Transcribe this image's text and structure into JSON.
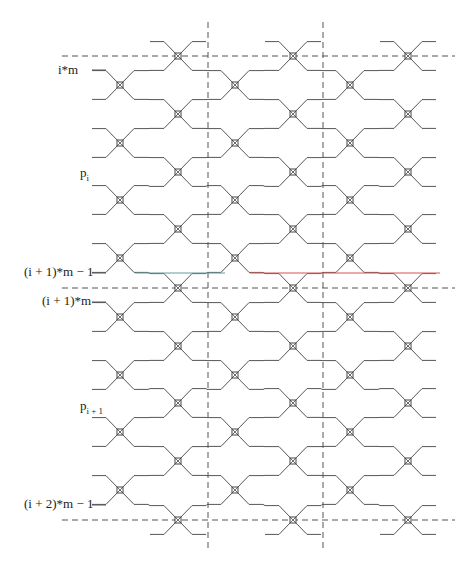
{
  "labels": {
    "row_top": "i*m",
    "block_i": "p",
    "block_i_sub": "i",
    "row_end_i": "(i + 1)*m − 1",
    "row_start_next": "(i + 1)*m",
    "block_next": "p",
    "block_next_sub": "i + 1",
    "row_end_next": "(i + 2)*m − 1"
  },
  "colors": {
    "wire": "#555555",
    "dash": "#555555",
    "node": "#444444",
    "highlight_teal": "#5a9e9a",
    "highlight_red": "#d9534f"
  },
  "geometry": {
    "colA_x": [
      120,
      235,
      350
    ],
    "colB_x": [
      178,
      293,
      408
    ],
    "colA_y": [
      85,
      143,
      200,
      258,
      317,
      375,
      432,
      490
    ],
    "colB_y": [
      56,
      114,
      172,
      229,
      288,
      346,
      403,
      461,
      520
    ],
    "half_pitch": 14.4,
    "diag_dx": 14,
    "wire_x_min": 92,
    "wire_x_max": 440,
    "h_dashes_y": [
      56,
      288,
      520
    ],
    "h_dash_x": [
      62,
      455
    ],
    "v_dashes_x": [
      208,
      323
    ],
    "v_dash_y": [
      22,
      552
    ]
  },
  "highlights": [
    {
      "y": 273,
      "x1": 135,
      "x2": 225,
      "color": "teal"
    },
    {
      "y": 273,
      "x1": 250,
      "x2": 440,
      "color": "red"
    }
  ]
}
